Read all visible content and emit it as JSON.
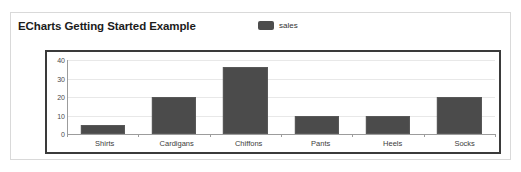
{
  "card": {
    "title": "ECharts Getting Started Example",
    "border_color": "#d9d9d9",
    "background": "#ffffff"
  },
  "legend": {
    "position": "top-center",
    "items": [
      {
        "label": "sales",
        "color": "#4d4d4d",
        "swatch": "rounded-rect-swatch"
      }
    ]
  },
  "chart_data": {
    "type": "bar",
    "title": "ECharts Getting Started Example",
    "xlabel": "",
    "ylabel": "",
    "categories": [
      "Shirts",
      "Cardigans",
      "Chiffons",
      "Pants",
      "Heels",
      "Socks"
    ],
    "series": [
      {
        "name": "sales",
        "color": "#4b4b4b",
        "values": [
          5,
          20,
          36,
          10,
          10,
          20
        ]
      }
    ],
    "ylim": [
      0,
      40
    ],
    "yticks": [
      0,
      10,
      20,
      30,
      40
    ],
    "ytick_labels": [
      "0",
      "10",
      "20",
      "30",
      "40"
    ],
    "grid": true,
    "grid_color": "#e8e8e8",
    "axis_color": "#9c9c9c",
    "legend": "top-center",
    "plot_border_color": "#3a3a3a"
  }
}
